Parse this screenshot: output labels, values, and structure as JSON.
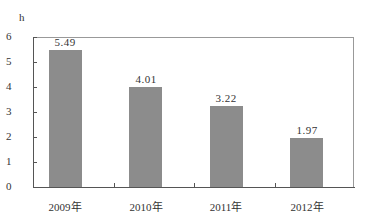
{
  "chart_data": {
    "type": "bar",
    "title": "",
    "xlabel": "",
    "ylabel": "h",
    "categories": [
      "2009年",
      "2010年",
      "2011年",
      "2012年"
    ],
    "values": [
      5.49,
      4.01,
      3.22,
      1.97
    ],
    "value_labels": [
      "5.49",
      "4.01",
      "3.22",
      "1.97"
    ],
    "ylim": [
      0,
      6
    ],
    "yticks": [
      "0",
      "1",
      "2",
      "3",
      "4",
      "5",
      "6"
    ],
    "grid": false,
    "legend": null,
    "bar_color": "#8c8c8c"
  }
}
